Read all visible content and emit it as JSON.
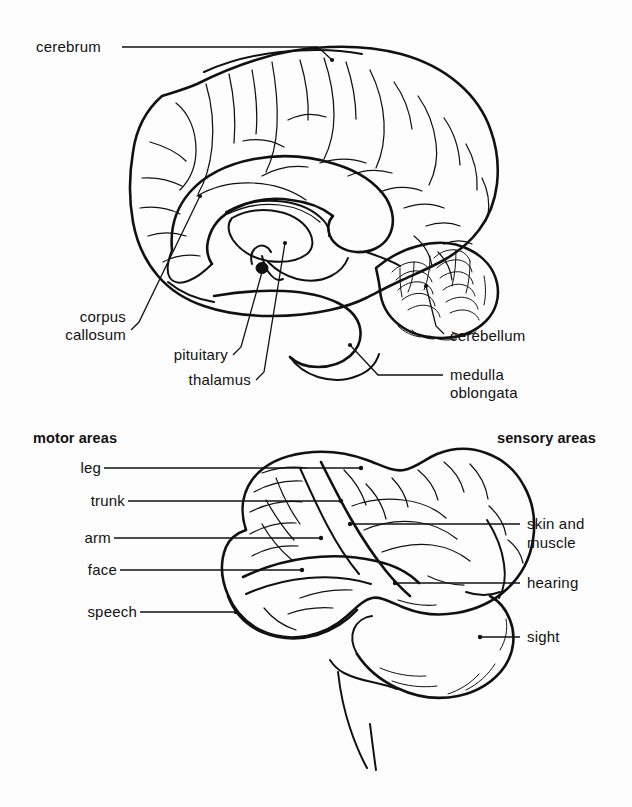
{
  "figure": {
    "background_color": "#fdfdfd",
    "ink_color": "#111111"
  },
  "upper_diagram": {
    "name": "midsagittal-section",
    "labels": [
      {
        "id": "cerebrum",
        "text": "cerebrum"
      },
      {
        "id": "corpus-callosum-line1",
        "text": "corpus"
      },
      {
        "id": "corpus-callosum-line2",
        "text": "callosum"
      },
      {
        "id": "pituitary",
        "text": "pituitary"
      },
      {
        "id": "thalamus",
        "text": "thalamus"
      },
      {
        "id": "cerebellum",
        "text": "cerebellum"
      },
      {
        "id": "medulla-line1",
        "text": "medulla"
      },
      {
        "id": "medulla-line2",
        "text": "oblongata"
      }
    ]
  },
  "lower_diagram": {
    "name": "lateral-view-functional-areas",
    "headers": {
      "left": "motor areas",
      "right": "sensory areas"
    },
    "motor_labels": [
      {
        "id": "leg",
        "text": "leg"
      },
      {
        "id": "trunk",
        "text": "trunk"
      },
      {
        "id": "arm",
        "text": "arm"
      },
      {
        "id": "face",
        "text": "face"
      },
      {
        "id": "speech",
        "text": "speech"
      }
    ],
    "sensory_labels": [
      {
        "id": "skin-and-muscle-line1",
        "text": "skin and"
      },
      {
        "id": "skin-and-muscle-line2",
        "text": "muscle"
      },
      {
        "id": "hearing",
        "text": "hearing"
      },
      {
        "id": "sight",
        "text": "sight"
      }
    ]
  }
}
